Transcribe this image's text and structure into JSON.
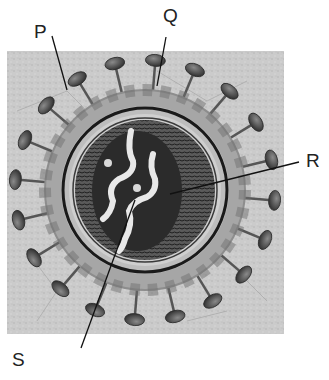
{
  "diagram": {
    "labels": [
      {
        "id": "P",
        "text": "P",
        "x": 34,
        "y": 22
      },
      {
        "id": "Q",
        "text": "Q",
        "x": 163,
        "y": 6
      },
      {
        "id": "R",
        "text": "R",
        "x": 306,
        "y": 151
      },
      {
        "id": "S",
        "text": "S",
        "x": 12,
        "y": 350
      }
    ],
    "colors": {
      "background": "#c9c9c9",
      "spike_head": "#4a4a4a",
      "envelope": "#a8a8a8",
      "capsid": "#3a3a3a",
      "core": "#2a2a2a",
      "rna": "#e6e6e6",
      "leader_line": "#111111"
    }
  }
}
